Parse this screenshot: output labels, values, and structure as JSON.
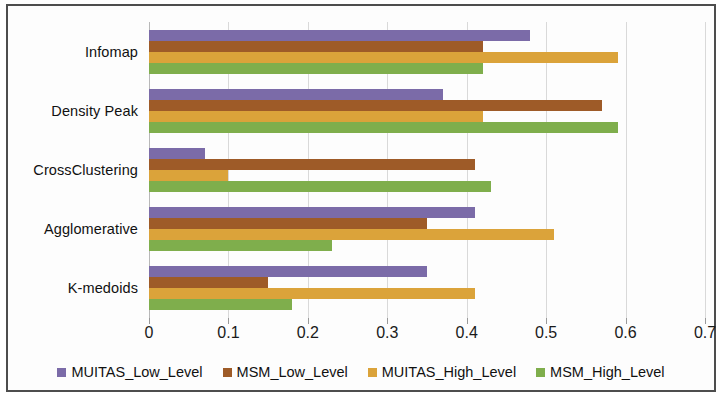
{
  "chart_data": {
    "type": "bar",
    "orientation": "horizontal",
    "title": "",
    "xlabel": "",
    "ylabel": "",
    "xlim": [
      0,
      0.7
    ],
    "grid": true,
    "legend_position": "bottom",
    "categories": [
      "K-medoids",
      "Agglomerative",
      "CrossClustering",
      "Density Peak",
      "Infomap"
    ],
    "tick_labels": [
      "0",
      "0.1",
      "0.2",
      "0.3",
      "0.4",
      "0.5",
      "0.6",
      "0.7"
    ],
    "tick_values": [
      0,
      0.1,
      0.2,
      0.3,
      0.4,
      0.5,
      0.6,
      0.7
    ],
    "series": [
      {
        "name": "MUITAS_Low_Level",
        "color": "#7b6ba8",
        "values": [
          0.35,
          0.41,
          0.07,
          0.37,
          0.48
        ]
      },
      {
        "name": "MSM_Low_Level",
        "color": "#9e5b28",
        "values": [
          0.15,
          0.35,
          0.41,
          0.57,
          0.42
        ]
      },
      {
        "name": "MUITAS_High_Level",
        "color": "#dba33a",
        "values": [
          0.41,
          0.51,
          0.1,
          0.42,
          0.59
        ]
      },
      {
        "name": "MSM_High_Level",
        "color": "#7fae4c",
        "values": [
          0.18,
          0.23,
          0.43,
          0.59,
          0.42
        ]
      }
    ]
  },
  "legend": {
    "items": [
      {
        "label": "MUITAS_Low_Level",
        "color": "#7b6ba8"
      },
      {
        "label": "MSM_Low_Level",
        "color": "#9e5b28"
      },
      {
        "label": "MUITAS_High_Level",
        "color": "#dba33a"
      },
      {
        "label": "MSM_High_Level",
        "color": "#7fae4c"
      }
    ]
  }
}
